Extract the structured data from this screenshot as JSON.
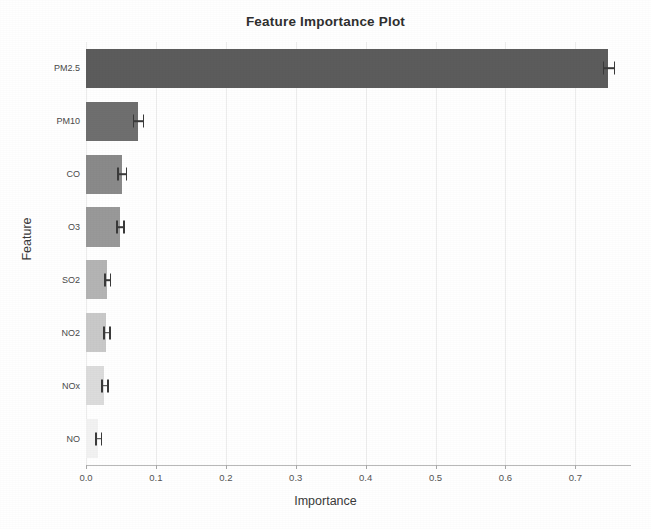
{
  "chart_data": {
    "type": "bar",
    "orientation": "horizontal",
    "title": "Feature Importance Plot",
    "xlabel": "Importance",
    "ylabel": "Feature",
    "categories": [
      "PM2.5",
      "PM10",
      "CO",
      "O3",
      "SO2",
      "NO2",
      "NOx",
      "NO"
    ],
    "values": [
      0.747,
      0.074,
      0.051,
      0.048,
      0.03,
      0.029,
      0.026,
      0.017
    ],
    "errors": [
      0.008,
      0.007,
      0.006,
      0.005,
      0.004,
      0.004,
      0.004,
      0.004
    ],
    "bar_colors": [
      "#5c5c5c",
      "#6f6f6f",
      "#8a8a8a",
      "#999999",
      "#b4b4b4",
      "#c9c9c9",
      "#dcdcdc",
      "#f2f2f2"
    ],
    "xlim": [
      0.0,
      0.771
    ],
    "ylim": [
      0,
      8
    ],
    "xticks": [
      0.0,
      0.1,
      0.2,
      0.3,
      0.4,
      0.5,
      0.6,
      0.7
    ],
    "xticklabels": [
      "0.0",
      "0.1",
      "0.2",
      "0.3",
      "0.4",
      "0.5",
      "0.6",
      "0.7"
    ],
    "grid": true,
    "grid_axis": "x",
    "grid_color": "#ededed",
    "legend": false,
    "error_bar_color": "#3a3a3a",
    "background_color": "#ffffff",
    "axis_color": "#b9b9b9"
  }
}
